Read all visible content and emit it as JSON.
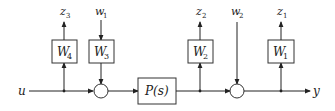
{
  "diagram": {
    "type": "block-diagram",
    "input_label": "u",
    "output_label": "y",
    "plant": {
      "label": "P(s)"
    },
    "weights": [
      {
        "id": "W4",
        "base": "W",
        "sub": "4",
        "output": {
          "base": "z",
          "sub": "3"
        }
      },
      {
        "id": "W3",
        "base": "W",
        "sub": "3",
        "input": {
          "base": "w",
          "sub": "1"
        }
      },
      {
        "id": "W2",
        "base": "W",
        "sub": "2",
        "output": {
          "base": "z",
          "sub": "2"
        }
      },
      {
        "id": "W1",
        "base": "W",
        "sub": "1",
        "output": {
          "base": "z",
          "sub": "1"
        }
      }
    ],
    "disturbance_w2": {
      "base": "w",
      "sub": "2"
    },
    "summing_junctions": 2
  }
}
